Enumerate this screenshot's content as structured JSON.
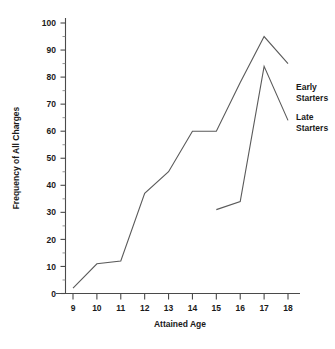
{
  "chart_data": {
    "type": "line",
    "title": "",
    "xlabel": "Attained Age",
    "ylabel": "Frequency of All Charges",
    "x": [
      9,
      10,
      11,
      12,
      13,
      14,
      15,
      16,
      17,
      18
    ],
    "xlim": [
      8.5,
      18.5
    ],
    "ylim": [
      0,
      100
    ],
    "xticks": [
      "9",
      "10",
      "11",
      "12",
      "13",
      "14",
      "15",
      "16",
      "17",
      "18"
    ],
    "yticks": [
      "0",
      "10",
      "20",
      "30",
      "40",
      "50",
      "60",
      "70",
      "80",
      "90",
      "100"
    ],
    "y_minor_step": 5,
    "grid": false,
    "legend_position": "right-inline",
    "series": [
      {
        "name": "Early Starters",
        "x": [
          9,
          10,
          11,
          12,
          13,
          14,
          15,
          16,
          17,
          18
        ],
        "values": [
          2,
          11,
          12,
          37,
          45,
          60,
          60,
          78,
          95,
          85
        ],
        "color": "#5a5a5a"
      },
      {
        "name": "Late Starters",
        "x": [
          15,
          16,
          17,
          18
        ],
        "values": [
          31,
          34,
          84,
          64
        ],
        "color": "#5a5a5a"
      }
    ]
  },
  "labels": {
    "early_line1": "Early",
    "early_line2": "Starters",
    "late_line1": "Late",
    "late_line2": "Starters"
  }
}
